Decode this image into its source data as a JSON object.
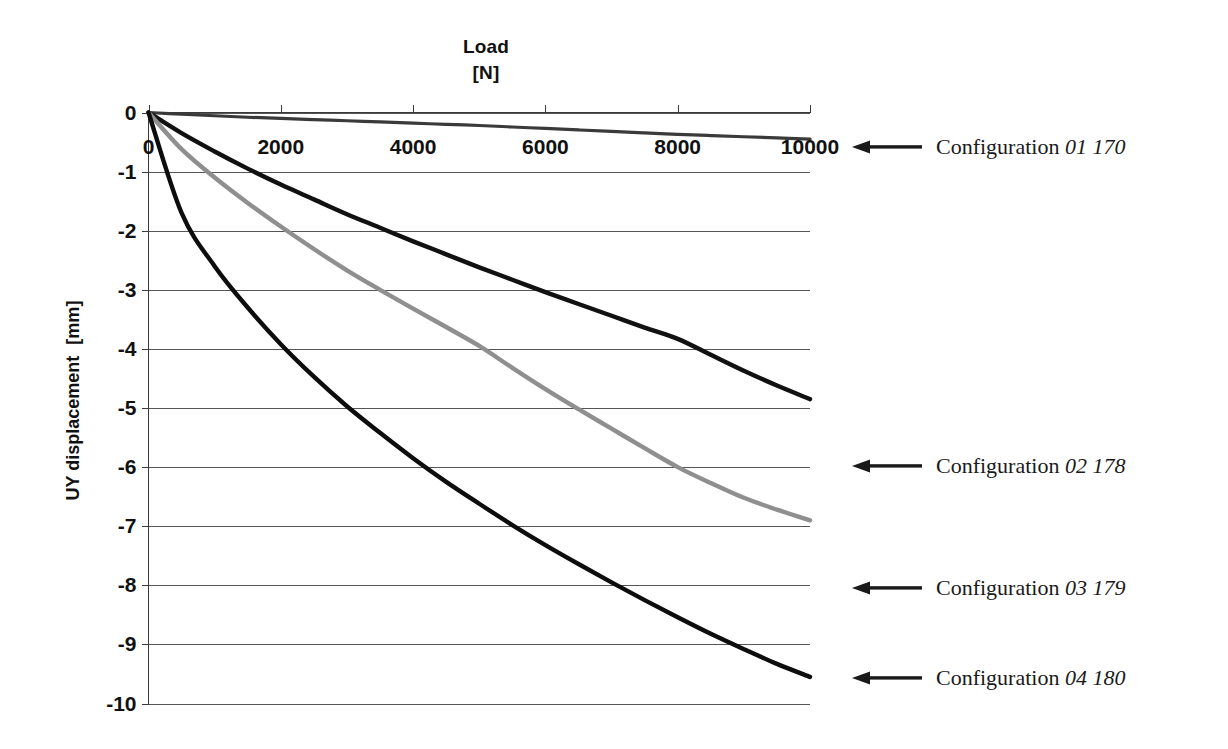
{
  "chart_data": {
    "type": "line",
    "title": "Load",
    "title_line1": "Load",
    "title_line2": "[N]",
    "xlabel": "Load [N]",
    "ylabel": "UY displacement [mm]",
    "ylabel_line1": "UY displacement",
    "ylabel_line2": "[mm]",
    "xlim": [
      0,
      10000
    ],
    "ylim": [
      -10,
      0
    ],
    "xticks": [
      0,
      2000,
      4000,
      6000,
      8000,
      10000
    ],
    "xtick_labels": [
      "0",
      "2000",
      "4000",
      "6000",
      "8000",
      "10000"
    ],
    "yticks": [
      0,
      -1,
      -2,
      -3,
      -4,
      -5,
      -6,
      -7,
      -8,
      -9,
      -10
    ],
    "ytick_labels": [
      "0",
      "-1",
      "-2",
      "-3",
      "-4",
      "-5",
      "-6",
      "-7",
      "-8",
      "-9",
      "-10"
    ],
    "grid": true,
    "grid_orientation": "horizontal",
    "legend_position": "right-annotations",
    "x": [
      0,
      500,
      1000,
      1500,
      2000,
      2500,
      3000,
      3500,
      4000,
      4500,
      5000,
      5500,
      6000,
      6500,
      7000,
      7500,
      8000,
      8500,
      9000,
      9500,
      10000
    ],
    "series": [
      {
        "name": "Configuration 01 170",
        "label": "Configuration",
        "label_number": "01 170",
        "color": "#3a3a3a",
        "values": [
          0,
          -0.03,
          -0.055,
          -0.08,
          -0.1,
          -0.12,
          -0.14,
          -0.16,
          -0.18,
          -0.2,
          -0.22,
          -0.245,
          -0.27,
          -0.295,
          -0.32,
          -0.345,
          -0.37,
          -0.39,
          -0.41,
          -0.43,
          -0.45
        ]
      },
      {
        "name": "Configuration 02 178",
        "label": "Configuration",
        "label_number": "02 178",
        "color": "#111111",
        "values": [
          0,
          -0.35,
          -0.66,
          -0.95,
          -1.22,
          -1.47,
          -1.72,
          -1.95,
          -2.18,
          -2.4,
          -2.62,
          -2.83,
          -3.04,
          -3.24,
          -3.44,
          -3.64,
          -3.83,
          -4.1,
          -4.37,
          -4.62,
          -4.85
        ]
      },
      {
        "name": "Configuration 03 179",
        "label": "Configuration",
        "label_number": "03 179",
        "color": "#8f8f8f",
        "values": [
          0,
          -0.62,
          -1.1,
          -1.53,
          -1.93,
          -2.31,
          -2.67,
          -3.0,
          -3.32,
          -3.63,
          -3.95,
          -4.32,
          -4.68,
          -5.02,
          -5.35,
          -5.68,
          -6.0,
          -6.27,
          -6.52,
          -6.72,
          -6.9
        ]
      },
      {
        "name": "Configuration 04 180",
        "label": "Configuration",
        "label_number": "04 180",
        "color": "#0d0d0d",
        "values": [
          0,
          -1.7,
          -2.6,
          -3.3,
          -3.92,
          -4.47,
          -4.97,
          -5.42,
          -5.85,
          -6.25,
          -6.62,
          -6.98,
          -7.32,
          -7.64,
          -7.95,
          -8.25,
          -8.54,
          -8.82,
          -9.08,
          -9.33,
          -9.55
        ]
      }
    ],
    "annotations": [
      {
        "id": "annotation-01",
        "label": "Configuration",
        "number": "01 170",
        "icon": "arrow-left-icon"
      },
      {
        "id": "annotation-02",
        "label": "Configuration",
        "number": "02 178",
        "icon": "arrow-left-icon"
      },
      {
        "id": "annotation-03",
        "label": "Configuration",
        "number": "03 179",
        "icon": "arrow-left-icon"
      },
      {
        "id": "annotation-04",
        "label": "Configuration",
        "number": "04 180",
        "icon": "arrow-left-icon"
      }
    ],
    "colors": {
      "axis": "#4a4a4a",
      "grid": "#5a5a5a",
      "background": "#ffffff",
      "text": "#111111"
    }
  }
}
